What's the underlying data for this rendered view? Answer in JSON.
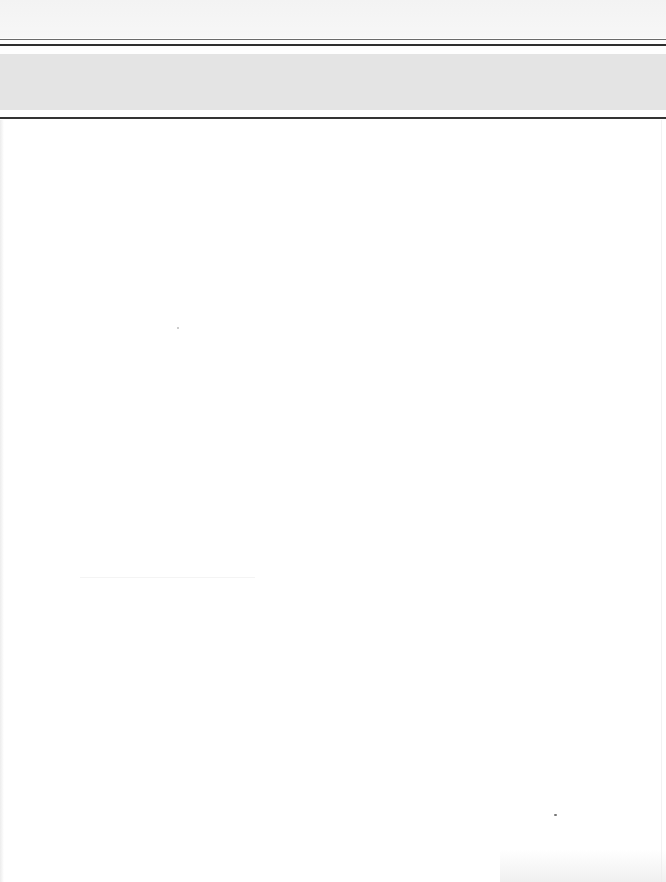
{
  "document": {
    "type": "scanned-page",
    "header": {
      "band_text": "",
      "band_color": "#e4e4e4",
      "rule_color": "#2e2e2e"
    },
    "body": {
      "text": ""
    },
    "page_color": "#ffffff"
  }
}
